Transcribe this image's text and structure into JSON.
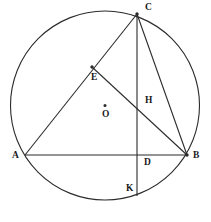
{
  "figure": {
    "width": 211,
    "height": 222,
    "background_color": "#ffffff",
    "stroke_color": "#2b2b2b",
    "label_color": "#1a1a1a"
  },
  "circle": {
    "name": "circumcircle",
    "center_x": 105,
    "center_y": 105.5,
    "radius": 94.5,
    "stroke_width": 1.1
  },
  "points": [
    {
      "id": "A",
      "label": "A",
      "x": 25,
      "y": 155,
      "label_x": 12,
      "label_y": 151,
      "dot": false
    },
    {
      "id": "B",
      "label": "B",
      "x": 187,
      "y": 155,
      "label_x": 193,
      "label_y": 151,
      "dot": true
    },
    {
      "id": "C",
      "label": "C",
      "x": 137,
      "y": 14,
      "label_x": 145,
      "label_y": 3,
      "dot": true
    },
    {
      "id": "E",
      "label": "E",
      "x": 92,
      "y": 67,
      "label_x": 91,
      "label_y": 73,
      "dot": true
    },
    {
      "id": "H",
      "label": "H",
      "x": 137,
      "y": 101,
      "label_x": 145,
      "label_y": 96,
      "dot": false
    },
    {
      "id": "D",
      "label": "D",
      "x": 137,
      "y": 155,
      "label_x": 144,
      "label_y": 158,
      "dot": false
    },
    {
      "id": "K",
      "label": "K",
      "x": 137,
      "y": 196,
      "label_x": 126,
      "label_y": 184,
      "dot": false
    },
    {
      "id": "O",
      "label": "O",
      "x": 105,
      "y": 105.5,
      "label_x": 102,
      "label_y": 110,
      "dot": true
    }
  ],
  "segments": [
    {
      "name": "segment-AB",
      "from": "A",
      "to": "B"
    },
    {
      "name": "segment-AC",
      "from": "A",
      "to": "C"
    },
    {
      "name": "segment-CB",
      "from": "C",
      "to": "B"
    },
    {
      "name": "segment-CK",
      "from": "C",
      "to": "K"
    },
    {
      "name": "segment-EB",
      "from": "E",
      "to": "B"
    }
  ],
  "labels": {
    "A": "A",
    "B": "B",
    "C": "C",
    "D": "D",
    "E": "E",
    "H": "H",
    "K": "K",
    "O": "O"
  }
}
